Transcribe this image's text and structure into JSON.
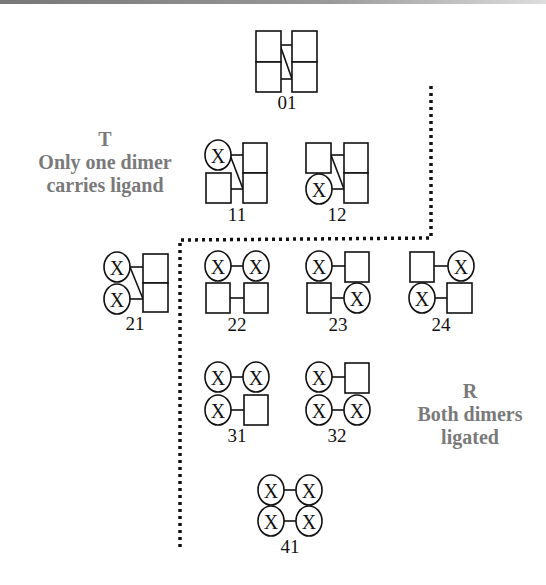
{
  "annotations": {
    "T": {
      "title": "T",
      "line1": "Only one dimer",
      "line2": "carries ligand"
    },
    "R": {
      "title": "R",
      "line1": "Both dimers",
      "line2": "ligated"
    }
  },
  "species": [
    {
      "id": "01",
      "label": "01",
      "ligands": 0
    },
    {
      "id": "11",
      "label": "11",
      "ligands": 1
    },
    {
      "id": "12",
      "label": "12",
      "ligands": 1
    },
    {
      "id": "21",
      "label": "21",
      "ligands": 2
    },
    {
      "id": "22",
      "label": "22",
      "ligands": 2
    },
    {
      "id": "23",
      "label": "23",
      "ligands": 2
    },
    {
      "id": "24",
      "label": "24",
      "ligands": 2
    },
    {
      "id": "31",
      "label": "31",
      "ligands": 3
    },
    {
      "id": "32",
      "label": "32",
      "ligands": 3
    },
    {
      "id": "41",
      "label": "41",
      "ligands": 4
    }
  ],
  "ligand_symbol": "X",
  "colors": {
    "annotation_text": "#7a7a7a",
    "line": "#111111"
  }
}
